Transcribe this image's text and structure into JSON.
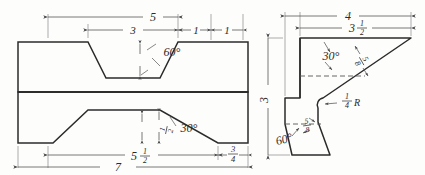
{
  "drawing": {
    "title": "Two-view orthographic engineering drawing",
    "type": "technical-drawing",
    "background_color": "#fdfdfc",
    "line_color": "#2b2b2b",
    "dim_line_color": "#555555",
    "views": [
      {
        "name": "front-view",
        "description": "Front view of block with V-notch on top and trapezoidal taper on bottom"
      },
      {
        "name": "side-view",
        "description": "Right side profile view of Z-shaped bent bracket"
      }
    ]
  },
  "front_view": {
    "dimensions": {
      "overall_top": "5",
      "notch_top_width": "3",
      "right_step_a": "1",
      "right_step_b": "1",
      "notch_angle": "60°",
      "lower_angle": "30°",
      "lower_thickness_num": "1",
      "lower_thickness_den": "2",
      "base_upper_num": "5",
      "base_upper_frac_num": "1",
      "base_upper_frac_den": "2",
      "base_right_num": "3",
      "base_right_den": "4",
      "overall_bottom": "7"
    }
  },
  "side_view": {
    "dimensions": {
      "overall_width": "4",
      "inner_width_whole": "3",
      "inner_width_num": "1",
      "inner_width_den": "2",
      "overall_height": "3",
      "upper_angle": "30°",
      "upper_thickness_num": "5",
      "upper_thickness_den": "8",
      "radius_num": "1",
      "radius_den": "4",
      "radius_label": "R",
      "lower_angle": "60°",
      "lower_thickness_num": "5",
      "lower_thickness_den": "8"
    }
  }
}
